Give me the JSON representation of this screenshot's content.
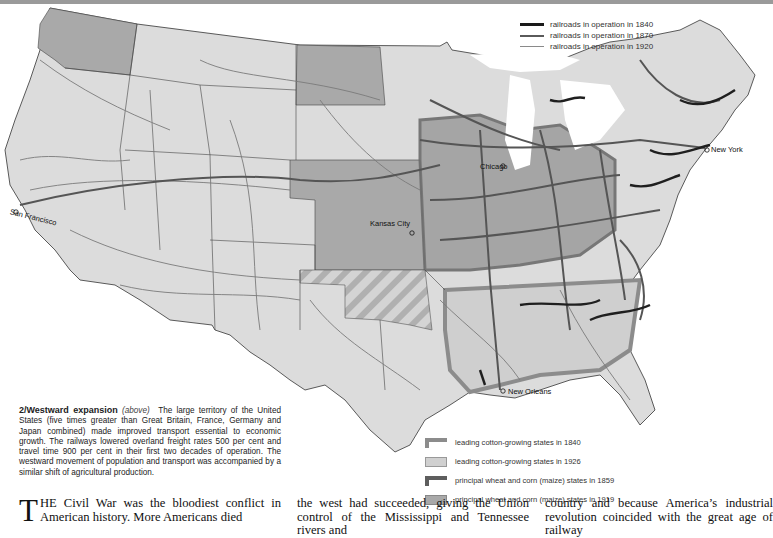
{
  "map": {
    "figure_number": "2",
    "cities": [
      {
        "name": "San Francisco",
        "x": 10,
        "y": 213
      },
      {
        "name": "Kansas City",
        "x": 369,
        "y": 224
      },
      {
        "name": "Chicago",
        "x": 479,
        "y": 168
      },
      {
        "name": "New York",
        "x": 710,
        "y": 148
      },
      {
        "name": "New Orleans",
        "x": 509,
        "y": 392
      }
    ],
    "railroad_legend": [
      {
        "label": "railroads in operation in 1840",
        "color": "#1a1a1a",
        "width": 3
      },
      {
        "label": "railroads in operation in 1870",
        "color": "#5a5a5a",
        "width": 2
      },
      {
        "label": "railroads in operation in 1920",
        "color": "#8a8a8a",
        "width": 1
      }
    ],
    "region_legend": [
      {
        "label": "leading cotton-growing states in 1840",
        "swatch": "cotton-1840"
      },
      {
        "label": "leading cotton-growing states in 1926",
        "swatch": "cotton-1926"
      },
      {
        "label": "principal wheat and corn (maize) states in 1859",
        "swatch": "wheat-1859"
      },
      {
        "label": "principal wheat and corn (maize) states in 1919",
        "swatch": "wheat-1919"
      }
    ],
    "colors": {
      "land": "#dcdcdc",
      "wheat_1919": "#a9a9a9",
      "wheat_1859_border": "#6d6d6d",
      "cotton_1840_border": "#8c8c8c",
      "cotton_1926": "#c8c8c8",
      "rail_dark": "#2a2a2a",
      "rail_mid": "#555555",
      "rail_light": "#7a7a7a"
    }
  },
  "caption": {
    "number": "2/",
    "title": "Westward expansion",
    "ref": "(above)",
    "text": "The large territory of the United States (five times greater than Great Britain, France, Germany and Japan combined) made improved transport essential to economic growth. The railways lowered overland freight rates 500 per cent and travel time 900 per cent in their first two decades of operation. The westward movement of population and transport was accompanied by a similar shift of agricultural production."
  },
  "body": {
    "col1_dropcap": "T",
    "col1": "HE Civil War was the bloodiest conflict in American history. More Americans died",
    "col2": "the west had succeeded, giving the Union control of the Mississippi and Tennessee rivers and",
    "col3": "country and because America’s industrial revolution coincided with the great age of railway"
  }
}
